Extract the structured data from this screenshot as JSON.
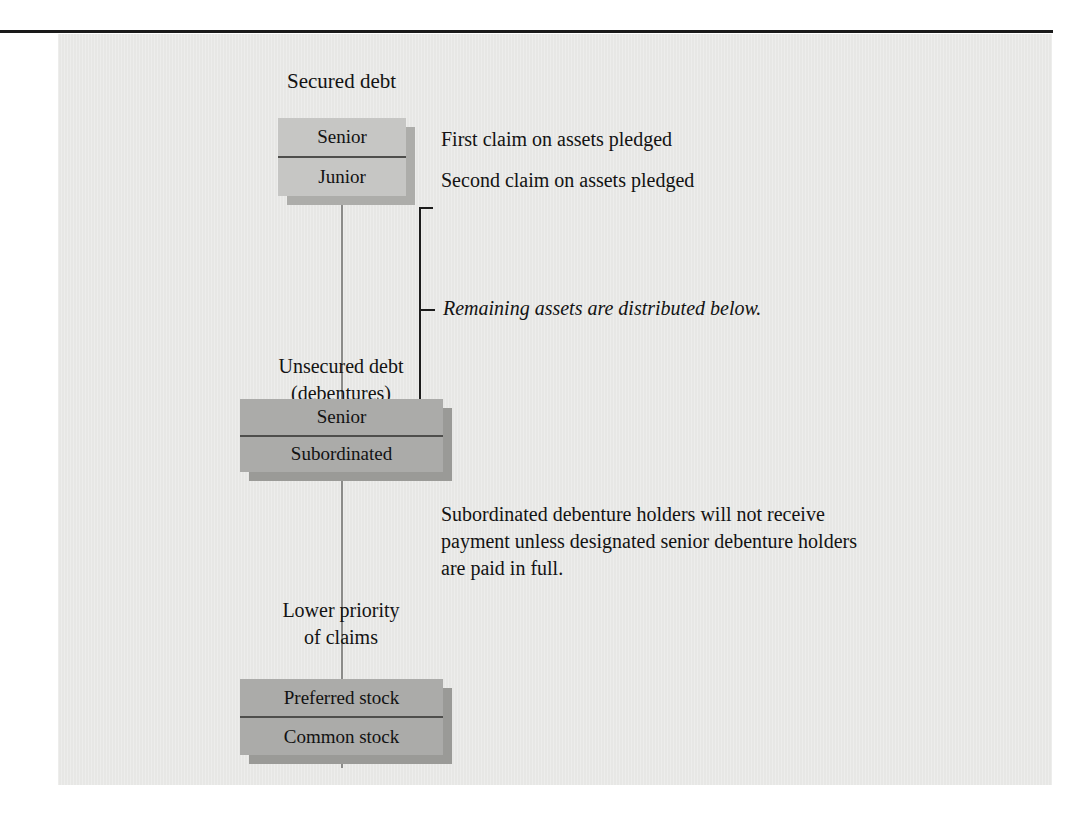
{
  "figure": {
    "top_label": "Secured debt",
    "secured_group": {
      "rows": [
        "Senior",
        "Junior"
      ],
      "annotations": [
        "First claim on assets pledged",
        "Second claim on assets pledged"
      ]
    },
    "middle_label_line1": "Unsecured debt",
    "middle_label_line2": "(debentures)",
    "bracket_note": "Remaining assets are distributed below.",
    "unsecured_group": {
      "rows": [
        "Senior",
        "Subordinated"
      ]
    },
    "subordination_note": "Subordinated debenture holders will not receive payment unless designated senior debenture holders are paid in full.",
    "lower_priority_line1": "Lower priority",
    "lower_priority_line2": "of claims",
    "equity_group": {
      "rows": [
        "Preferred stock",
        "Common stock"
      ]
    },
    "colors": {
      "panel_background": "#e8e8e6",
      "box_light": "#c6c6c4",
      "box_dark": "#ababa9",
      "shadow_light": "#adadaa",
      "shadow_dark": "#9a9a97",
      "rule": "#1a1a1a",
      "connector": "#8b8b89",
      "text": "#131313"
    }
  }
}
